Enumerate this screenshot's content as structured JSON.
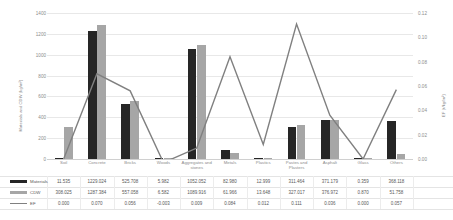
{
  "chart_data": {
    "type": "bar",
    "title": "",
    "xlabel": "",
    "ylabel": "Materials and CDW (kg/m²)",
    "ylabel_secondary": "EF (t/kg/m²)",
    "ylim": [
      0,
      1400
    ],
    "ylim_secondary": [
      0.0,
      0.12
    ],
    "yticks": [
      "0",
      "200",
      "400",
      "600",
      "800",
      "1000",
      "1200",
      "1400"
    ],
    "yticks_secondary": [
      "0.00",
      "0.02",
      "0.04",
      "0.06",
      "0.08",
      "0.10",
      "0.12"
    ],
    "grid": true,
    "legend_position": "table-below",
    "categories": [
      "Soil",
      "Concrete",
      "Bricks",
      "Woods",
      "Aggregates and stones",
      "Metals",
      "Plastics",
      "Pastes and Plasters",
      "Asphalt",
      "Glass",
      "Others"
    ],
    "series": [
      {
        "name": "Materials",
        "type": "bar",
        "axis": "left",
        "color": "#262626",
        "values": [
          11.535,
          1229.024,
          525.708,
          5.982,
          1052.052,
          82.98,
          12.999,
          311.464,
          371.179,
          0.359,
          368.118
        ],
        "labels": [
          "11.535",
          "1229.024",
          "525.708",
          "5.982",
          "1052.052",
          "82.980",
          "12.999",
          "311.464",
          "371.179",
          "0.359",
          "368.118"
        ]
      },
      {
        "name": "CDW",
        "type": "bar",
        "axis": "left",
        "color": "#a6a6a6",
        "values": [
          308.025,
          1287.384,
          557.058,
          6.582,
          1089.916,
          61.966,
          13.648,
          327.017,
          376.972,
          0.87,
          51.758
        ],
        "labels": [
          "308.025",
          "1287.384",
          "557.058",
          "6.582",
          "1089.916",
          "61.966",
          "13.648",
          "327.017",
          "376.972",
          "0.870",
          "51.758"
        ]
      },
      {
        "name": "EF",
        "type": "line",
        "axis": "right",
        "color": "#808080",
        "values": [
          0.0,
          0.07,
          0.056,
          -0.003,
          0.009,
          0.084,
          0.012,
          0.111,
          0.036,
          0.0,
          0.057
        ],
        "labels": [
          "0.000",
          "0.070",
          "0.056",
          "-0.003",
          "0.009",
          "0.084",
          "0.012",
          "0.111",
          "0.036",
          "0.000",
          "0.057"
        ]
      }
    ]
  }
}
